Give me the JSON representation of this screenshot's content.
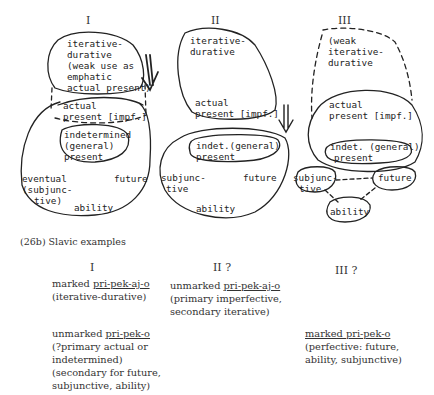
{
  "diagrams": [
    {
      "numeral": "I",
      "top_region": [
        "iterative-",
        "durative",
        "(weak use as",
        "emphatic",
        "actual present)"
      ],
      "actual": [
        "actual",
        "present [impf.]"
      ],
      "indet": [
        "indetermined",
        "(general)",
        "present"
      ],
      "eventual": [
        "eventual",
        "(subjunc-",
        "tive)"
      ],
      "future": "future",
      "ability": "ability"
    },
    {
      "numeral": "II",
      "top_region": [
        "iterative-",
        "durative"
      ],
      "actual": [
        "actual",
        "present [impf.]"
      ],
      "indet": [
        "indet.(general)",
        "present"
      ],
      "subjunctive": [
        "subjunc-",
        "tive"
      ],
      "future": "future",
      "ability": "ability"
    },
    {
      "numeral": "III",
      "top_region": [
        "(weak",
        "iterative-",
        "durative"
      ],
      "actual": [
        "actual",
        "present [impf.]"
      ],
      "indet": [
        "indet. (general)",
        "present"
      ],
      "subjunctive": [
        "subjunc-",
        "tive"
      ],
      "future": "future",
      "ability": "ability"
    }
  ],
  "arrows": {
    "glyph": "⇓"
  },
  "caption": "(26b)  Slavic examples",
  "examples": {
    "col1": {
      "numeral": "I",
      "block1": {
        "prefix": "marked ",
        "form": "pri-pek-aj-o",
        "lines": [
          "(iterative-durative)"
        ]
      },
      "block2": {
        "prefix": "unmarked ",
        "form": "pri-pek-o",
        "lines": [
          "(?primary actual or",
          "indetermined)",
          "(secondary for future,",
          "subjunctive, ability)"
        ]
      }
    },
    "col2": {
      "numeral": "II ?",
      "block1": {
        "prefix": "unmarked ",
        "form": "pri-pek-aj-o",
        "lines": [
          "(primary imperfective,",
          "secondary iterative)"
        ]
      }
    },
    "col3": {
      "numeral": "III ?",
      "block1": {
        "prefix": "marked pri-pek-o",
        "form": "",
        "lines": [
          "(perfective: future,",
          "ability, subjunctive)"
        ]
      }
    }
  }
}
